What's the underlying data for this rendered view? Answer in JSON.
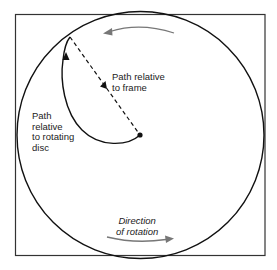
{
  "diagram": {
    "type": "rotating-disc-motion",
    "colors": {
      "frame": "#333333",
      "disc": "#111111",
      "path": "#111111",
      "rotation_arrow": "#777777",
      "text": "#222222"
    }
  },
  "labels": {
    "path_frame": {
      "lines": [
        "Path relative",
        "to frame"
      ]
    },
    "path_disc": {
      "lines": [
        "Path",
        "relative",
        "to rotating",
        "disc"
      ]
    },
    "rotation": {
      "lines": [
        "Direction",
        "of rotation"
      ]
    }
  },
  "icons": {
    "top_rotation_arrow": "arrow-left-curved",
    "bottom_rotation_arrow": "arrow-right-curved",
    "center_point": "dot",
    "frame_path_arrow": "arrowhead-down-right",
    "disc_path_arrow": "arrowhead-up"
  }
}
